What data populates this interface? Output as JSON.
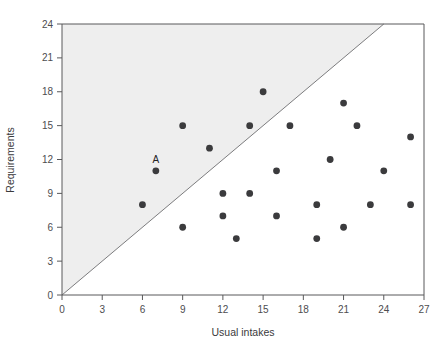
{
  "chart_data": {
    "type": "scatter",
    "title": "",
    "xlabel": "Usual intakes",
    "ylabel": "Requirements",
    "xlim": [
      0,
      27
    ],
    "ylim": [
      0,
      24
    ],
    "xticks": [
      0,
      3,
      6,
      9,
      12,
      15,
      18,
      21,
      24,
      27
    ],
    "yticks": [
      0,
      3,
      6,
      9,
      12,
      15,
      18,
      21,
      24
    ],
    "grid": false,
    "legend": "none",
    "reference_line": {
      "name": "identity-line",
      "description": "y = x diagonal line",
      "from": [
        0,
        0
      ],
      "to": [
        24,
        24
      ]
    },
    "shaded_region": {
      "name": "above-identity-region",
      "description": "shaded area where requirements exceed usual intakes",
      "color": "#eeeeee"
    },
    "point_color": "#3b3b3d",
    "points": [
      {
        "x": 6,
        "y": 8,
        "label": ""
      },
      {
        "x": 7,
        "y": 11,
        "label": "A"
      },
      {
        "x": 9,
        "y": 15,
        "label": ""
      },
      {
        "x": 9,
        "y": 6,
        "label": ""
      },
      {
        "x": 11,
        "y": 13,
        "label": ""
      },
      {
        "x": 12,
        "y": 9,
        "label": ""
      },
      {
        "x": 12,
        "y": 7,
        "label": ""
      },
      {
        "x": 13,
        "y": 5,
        "label": ""
      },
      {
        "x": 14,
        "y": 9,
        "label": ""
      },
      {
        "x": 14,
        "y": 15,
        "label": ""
      },
      {
        "x": 15,
        "y": 18,
        "label": ""
      },
      {
        "x": 16,
        "y": 11,
        "label": ""
      },
      {
        "x": 16,
        "y": 7,
        "label": ""
      },
      {
        "x": 17,
        "y": 15,
        "label": ""
      },
      {
        "x": 19,
        "y": 8,
        "label": ""
      },
      {
        "x": 19,
        "y": 5,
        "label": ""
      },
      {
        "x": 20,
        "y": 12,
        "label": ""
      },
      {
        "x": 21,
        "y": 17,
        "label": ""
      },
      {
        "x": 21,
        "y": 6,
        "label": ""
      },
      {
        "x": 22,
        "y": 15,
        "label": ""
      },
      {
        "x": 23,
        "y": 8,
        "label": ""
      },
      {
        "x": 24,
        "y": 11,
        "label": ""
      },
      {
        "x": 26,
        "y": 14,
        "label": ""
      },
      {
        "x": 26,
        "y": 8,
        "label": ""
      }
    ]
  }
}
